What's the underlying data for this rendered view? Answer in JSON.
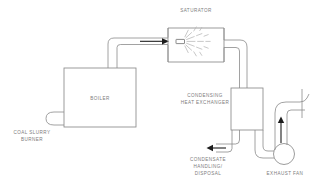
{
  "diagram": {
    "background_color": "#ffffff",
    "line_color": "#8a8a8a",
    "label_color": "#7c7c7c",
    "arrow_color": "#1d1d1d",
    "spray_color": "#b6b6b6"
  },
  "labels": {
    "saturator": "SATURATOR",
    "boiler": "BOILER",
    "burner_line1": "COAL SLURRY",
    "burner_line2": "BURNER",
    "hx_line1": "CONDENSING",
    "hx_line2": "HEAT EXCHANGER",
    "condensate_line1": "CONDENSATE",
    "condensate_line2": "HANDLING/",
    "condensate_line3": "DISPOSAL",
    "exhaust_fan": "EXHAUST FAN"
  },
  "components": [
    {
      "name": "coal-slurry-burner",
      "label": "COAL SLURRY BURNER",
      "shape": "loop"
    },
    {
      "name": "boiler",
      "label": "BOILER",
      "shape": "rectangle"
    },
    {
      "name": "saturator",
      "label": "SATURATOR",
      "shape": "rectangle-with-nozzle"
    },
    {
      "name": "spray-nozzle",
      "label": "",
      "shape": "nozzle"
    },
    {
      "name": "condensing-heat-exchanger",
      "label": "CONDENSING HEAT EXCHANGER",
      "shape": "rectangle"
    },
    {
      "name": "condensate-handling-disposal",
      "label": "CONDENSATE HANDLING/ DISPOSAL",
      "shape": "arrow-outlet"
    },
    {
      "name": "exhaust-fan",
      "label": "EXHAUST FAN",
      "shape": "circle"
    },
    {
      "name": "stack",
      "label": "",
      "shape": "vertical-line"
    }
  ],
  "flows": [
    {
      "name": "boiler-to-saturator",
      "from": "boiler",
      "to": "saturator",
      "direction": "right"
    },
    {
      "name": "saturator-to-heat-exchanger",
      "from": "saturator",
      "to": "condensing-heat-exchanger",
      "direction": "down"
    },
    {
      "name": "heat-exchanger-to-condensate",
      "from": "condensing-heat-exchanger",
      "to": "condensate-handling-disposal",
      "direction": "left"
    },
    {
      "name": "heat-exchanger-to-exhaust-fan",
      "from": "condensing-heat-exchanger",
      "to": "exhaust-fan",
      "direction": "down"
    },
    {
      "name": "exhaust-fan-to-stack",
      "from": "exhaust-fan",
      "to": "stack",
      "direction": "up"
    }
  ]
}
